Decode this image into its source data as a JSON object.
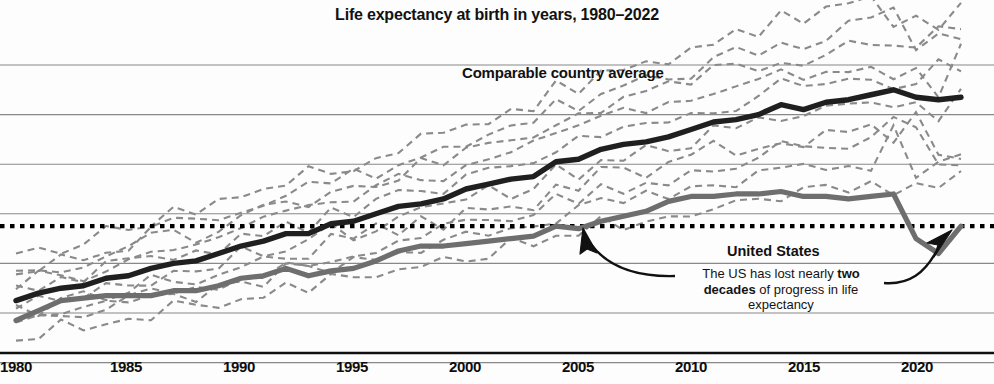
{
  "chart_data": {
    "type": "line",
    "title": "Life expectancy at birth in years, 1980–2022",
    "xlabel": "",
    "ylabel": "",
    "xlim": [
      1980,
      2022
    ],
    "ylim": [
      68,
      86
    ],
    "grid": true,
    "gridlines_y": [
      84,
      82,
      80,
      78,
      76,
      74,
      72
    ],
    "legend_position": "inline-annotations",
    "x": [
      1980,
      1981,
      1982,
      1983,
      1984,
      1985,
      1986,
      1987,
      1988,
      1989,
      1990,
      1991,
      1992,
      1993,
      1994,
      1995,
      1996,
      1997,
      1998,
      1999,
      2000,
      2001,
      2002,
      2003,
      2004,
      2005,
      2006,
      2007,
      2008,
      2009,
      2010,
      2011,
      2012,
      2013,
      2014,
      2015,
      2016,
      2017,
      2018,
      2019,
      2020,
      2021,
      2022
    ],
    "series": [
      {
        "name": "Comparable country average",
        "style": "solid-thick-dark",
        "color": "#1f1f1f",
        "values": [
          74.5,
          74.8,
          75.0,
          75.1,
          75.4,
          75.5,
          75.8,
          76.0,
          76.1,
          76.4,
          76.7,
          76.9,
          77.2,
          77.2,
          77.6,
          77.7,
          78.0,
          78.3,
          78.4,
          78.6,
          79.0,
          79.2,
          79.4,
          79.5,
          80.1,
          80.2,
          80.6,
          80.8,
          80.9,
          81.1,
          81.4,
          81.7,
          81.8,
          82.0,
          82.4,
          82.2,
          82.5,
          82.6,
          82.8,
          83.0,
          82.7,
          82.6,
          82.7
        ]
      },
      {
        "name": "United States",
        "style": "solid-thick-gray",
        "color": "#6e6e6e",
        "values": [
          73.7,
          74.1,
          74.5,
          74.6,
          74.7,
          74.7,
          74.7,
          74.9,
          74.9,
          75.1,
          75.4,
          75.5,
          75.8,
          75.5,
          75.7,
          75.8,
          76.1,
          76.5,
          76.7,
          76.7,
          76.8,
          76.9,
          77.0,
          77.1,
          77.5,
          77.4,
          77.7,
          77.9,
          78.1,
          78.5,
          78.7,
          78.7,
          78.8,
          78.8,
          78.9,
          78.7,
          78.7,
          78.6,
          78.7,
          78.8,
          77.0,
          76.4,
          77.5
        ]
      }
    ],
    "band_label": "Individual comparable countries (dashed gray lines)",
    "band_series_count": 10,
    "reference_line": {
      "label": "US 2022 level reference",
      "style": "dotted-thick-black",
      "value": 77.5
    },
    "annotations": [
      {
        "id": "comparable-average",
        "text": "Comparable country average"
      },
      {
        "id": "united-states",
        "text": "United States"
      },
      {
        "id": "note",
        "text": "The US has lost nearly two decades of progress in life expectancy",
        "bold_fragment": "two decades"
      }
    ]
  },
  "title": "Life expectancy at birth in years, 1980–2022",
  "labels": {
    "comparable": "Comparable country average",
    "united_states": "United States",
    "note_part1": "The US has lost nearly ",
    "note_bold": "two decades",
    "note_part2": " of progress in life expectancy"
  },
  "axis": {
    "x_ticks": [
      {
        "label": "1980",
        "x": 16
      },
      {
        "label": "1985",
        "x": 126
      },
      {
        "label": "1990",
        "x": 239
      },
      {
        "label": "1995",
        "x": 352
      },
      {
        "label": "2000",
        "x": 465
      },
      {
        "label": "2005",
        "x": 578
      },
      {
        "label": "2010",
        "x": 691
      },
      {
        "label": "2015",
        "x": 804
      },
      {
        "label": "2020",
        "x": 917
      }
    ]
  },
  "colors": {
    "average_line": "#1f1f1f",
    "us_line": "#6e6e6e",
    "band_line": "#8a8a8a",
    "gridline": "#888888",
    "axis": "#101010",
    "reference_dotted": "#000000",
    "background": "#fdfdfd",
    "text": "#121212"
  }
}
